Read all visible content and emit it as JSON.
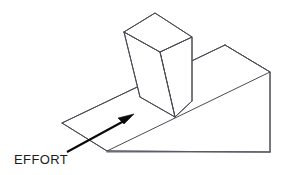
{
  "diagram": {
    "background_color": "#ffffff",
    "line_color": "#4a4a52",
    "ground_line_color": "#6b6b73",
    "arrow_color": "#0a0a0a",
    "text_color": "#1b1b1b",
    "labels": {
      "effort": "EFFORT"
    },
    "parts": {
      "ramp_name": "inclined-plane-wedge",
      "block_name": "rectangular-block",
      "arrow_name": "effort-force-arrow"
    },
    "geometry": {
      "ramp_incline_top_face": "62,123 225,45 270,72 107,151",
      "ramp_right_back_face": "270,72 270,152 107,151",
      "ramp_ridge_top": "225,45 270,72",
      "ramp_right_vertical": "270,72 270,152",
      "ramp_base_bottom": "107,151 270,152",
      "block_top_face": "124,32 155,13 192,37 160,52",
      "block_left_face": "124,32 160,52 175,117 140,97",
      "block_right_face": "160,52 192,37 192,101 175,117",
      "arrow_shaft": "67,152 125,120",
      "arrow_head_tip": "133,115",
      "label_effort_position": "14,163"
    }
  }
}
